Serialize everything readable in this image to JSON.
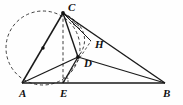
{
  "figure": {
    "canvas": {
      "width": 183,
      "height": 105,
      "background": "#fefefe"
    },
    "stroke_color": "#1a1a1a",
    "dash_color": "#2b2b2b",
    "label_color": "#111111"
  },
  "points": {
    "A": {
      "label": "A",
      "x": 22,
      "y": 83,
      "label_x": 19,
      "label_y": 97
    },
    "B": {
      "label": "B",
      "x": 165,
      "y": 83,
      "label_x": 163,
      "label_y": 97
    },
    "C": {
      "label": "C",
      "x": 63,
      "y": 13,
      "label_x": 68,
      "label_y": 11
    },
    "D": {
      "label": "D",
      "x": 78,
      "y": 57,
      "label_x": 84,
      "label_y": 67
    },
    "E": {
      "label": "E",
      "x": 63,
      "y": 83,
      "label_x": 60,
      "label_y": 97
    },
    "H": {
      "label": "H",
      "x": 91,
      "y": 41,
      "label_x": 95,
      "label_y": 48
    },
    "O": {
      "label": "",
      "x": 43,
      "y": 48,
      "label_x": 0,
      "label_y": 0
    }
  },
  "segments": [
    {
      "name": "segment-AC",
      "from": "A",
      "to": "C",
      "style": "solid"
    },
    {
      "name": "segment-AB",
      "from": "A",
      "to": "B",
      "style": "solid"
    },
    {
      "name": "segment-AD",
      "from": "A",
      "to": "D",
      "style": "solid"
    },
    {
      "name": "segment-CB",
      "from": "C",
      "to": "B",
      "style": "solid"
    },
    {
      "name": "segment-CD",
      "from": "C",
      "to": "D",
      "style": "solid"
    },
    {
      "name": "segment-CH",
      "from": "C",
      "to": "H",
      "style": "solid"
    },
    {
      "name": "segment-DB",
      "from": "D",
      "to": "B",
      "style": "solid"
    },
    {
      "name": "segment-ED",
      "from": "E",
      "to": "D",
      "style": "solid"
    },
    {
      "name": "segment-CE",
      "from": "C",
      "to": "E",
      "style": "dashed"
    },
    {
      "name": "segment-EH",
      "from": "E",
      "to": "H",
      "style": "dashed"
    }
  ],
  "circle": {
    "name": "circumcircle-ACE",
    "center_x": 43,
    "center_y": 48,
    "radius": 37,
    "style": "dashed",
    "through": [
      "A",
      "C",
      "E"
    ]
  },
  "arc": {
    "name": "dashed-arc-C-to-D",
    "style": "dashed",
    "path": "M 63 13 C 86 24, 90 42, 78 57"
  },
  "marks": [
    {
      "name": "center-dot-on-AC",
      "type": "dot",
      "x": 43,
      "y": 48
    },
    {
      "name": "vertex-dot-D",
      "type": "dot",
      "x": 78,
      "y": 57
    },
    {
      "name": "vertex-dot-C",
      "type": "dot",
      "x": 63,
      "y": 13
    },
    {
      "name": "angle-ticks-at-C",
      "type": "angle-ticks",
      "x": 76,
      "y": 24
    },
    {
      "name": "right-angle-mark-at-E",
      "type": "right-angle",
      "x": 63,
      "y": 83
    }
  ],
  "labels_order": [
    "C",
    "H",
    "D",
    "A",
    "E",
    "B"
  ]
}
